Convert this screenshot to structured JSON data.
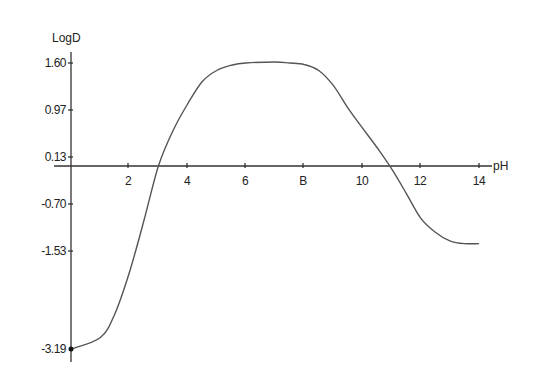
{
  "chart_data": {
    "type": "line",
    "title": "",
    "xlabel": "pH",
    "ylabel": "LogD",
    "xlim": [
      0,
      14
    ],
    "x_ticks": [
      2,
      4,
      6,
      8,
      10,
      12,
      14
    ],
    "x_tick_labels": [
      "2",
      "4",
      "6",
      "B",
      "10",
      "12",
      "14"
    ],
    "y_ticks": [
      1.6,
      0.97,
      0.13,
      -0.7,
      -1.53,
      -3.19
    ],
    "y_tick_labels": [
      "1.60",
      "0.97",
      "0.13",
      "-0.70",
      "-1.53",
      "-3.19"
    ],
    "grid": false,
    "legend": null,
    "series": [
      {
        "name": "LogD",
        "x": [
          0,
          1,
          1.5,
          2,
          2.5,
          3.0,
          3.5,
          4,
          4.5,
          5,
          5.5,
          6,
          7,
          7.5,
          8,
          8.5,
          9,
          9.5,
          10,
          10.5,
          11,
          11.5,
          12,
          12.5,
          13,
          13.5,
          14
        ],
        "y": [
          -3.19,
          -3.0,
          -2.6,
          -1.9,
          -1.0,
          0.0,
          0.6,
          1.05,
          1.35,
          1.5,
          1.57,
          1.6,
          1.61,
          1.6,
          1.58,
          1.5,
          1.3,
          1.0,
          0.65,
          0.3,
          -0.05,
          -0.5,
          -0.95,
          -1.2,
          -1.35,
          -1.4,
          -1.4
        ]
      }
    ]
  },
  "axes": {
    "x_title": "pH",
    "y_title": "LogD"
  }
}
